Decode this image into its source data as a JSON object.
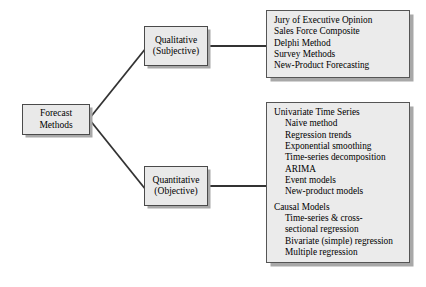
{
  "diagram": {
    "title": "Forecast Methods",
    "root": {
      "id": "forecast-methods",
      "label": "Forecast\nMethods"
    },
    "branches": [
      {
        "id": "qualitative",
        "label": "Qualitative\n(Subjective)",
        "items": [
          {
            "text": "Jury of Executive Opinion",
            "level": 0,
            "gap": false
          },
          {
            "text": "Sales Force Composite",
            "level": 0,
            "gap": false
          },
          {
            "text": "Delphi Method",
            "level": 0,
            "gap": false
          },
          {
            "text": "Survey Methods",
            "level": 0,
            "gap": false
          },
          {
            "text": "New-Product Forecasting",
            "level": 0,
            "gap": false
          }
        ]
      },
      {
        "id": "quantitative",
        "label": "Quantitative\n(Objective)",
        "items": [
          {
            "text": "Univariate Time Series",
            "level": 0,
            "gap": false
          },
          {
            "text": "Naive method",
            "level": 1,
            "gap": false
          },
          {
            "text": "Regression trends",
            "level": 1,
            "gap": false
          },
          {
            "text": "Exponential smoothing",
            "level": 1,
            "gap": false
          },
          {
            "text": "Time-series decomposition",
            "level": 1,
            "gap": false
          },
          {
            "text": "ARIMA",
            "level": 1,
            "gap": false
          },
          {
            "text": "Event models",
            "level": 1,
            "gap": false
          },
          {
            "text": "New-product models",
            "level": 1,
            "gap": false
          },
          {
            "text": "Causal Models",
            "level": 0,
            "gap": true
          },
          {
            "text": "Time-series & cross-",
            "level": 1,
            "gap": false
          },
          {
            "text": "sectional regression",
            "level": 1,
            "gap": false
          },
          {
            "text": "Bivariate (simple) regression",
            "level": 1,
            "gap": false
          },
          {
            "text": "Multiple regression",
            "level": 1,
            "gap": false
          }
        ]
      }
    ],
    "colors": {
      "node_fill": "#e9e9e9",
      "node_border": "#4a4a4a",
      "shadow": "#a8a8a8",
      "connector": "#333333",
      "background": "#ffffff",
      "text": "#000000"
    }
  }
}
